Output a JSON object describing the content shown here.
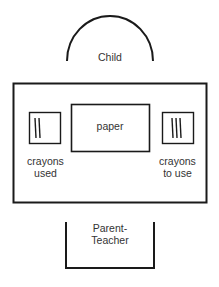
{
  "diagram": {
    "child_label": "Child",
    "paper_label": "paper",
    "crayons_used_label_line1": "crayons",
    "crayons_used_label_line2": "used",
    "crayons_to_use_label_line1": "crayons",
    "crayons_to_use_label_line2": "to use",
    "parent_teacher_label_line1": "Parent-",
    "parent_teacher_label_line2": "Teacher",
    "crayons_used_count": 2,
    "crayons_to_use_count": 3,
    "stroke_color": "#1a1a1a"
  }
}
